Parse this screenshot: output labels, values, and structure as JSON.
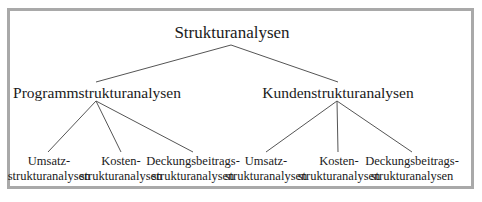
{
  "diagram": {
    "root": {
      "label": "Strukturanalysen"
    },
    "branches": [
      {
        "label": "Programmstrukturanalysen",
        "children": [
          {
            "line1": "Umsatz-",
            "line2": "strukturanalysen"
          },
          {
            "line1": "Kosten-",
            "line2": "strukturanalysen"
          },
          {
            "line1": "Deckungsbeitrags-",
            "line2": "strukturanalysen"
          }
        ]
      },
      {
        "label": "Kundenstrukturanalysen",
        "children": [
          {
            "line1": "Umsatz-",
            "line2": "strukturanalysen"
          },
          {
            "line1": "Kosten-",
            "line2": "strukturanalysen"
          },
          {
            "line1": "Deckungsbeitrags-",
            "line2": "strukturanalysen"
          }
        ]
      }
    ],
    "colors": {
      "frame": "#a9a9a9",
      "line": "#555555",
      "text": "#1a1a1a"
    }
  }
}
